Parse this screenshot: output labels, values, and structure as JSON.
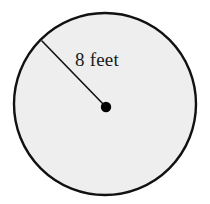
{
  "figure": {
    "kind": "circle-with-radius-diagram",
    "background_color": "#ffffff",
    "circle": {
      "fill_color": "#eeeeee",
      "stroke_color": "#111111",
      "stroke_width": 2.4,
      "center_x": 105,
      "center_y": 104,
      "radius": 91
    },
    "center_dot": {
      "color": "#000000",
      "x": 106,
      "y": 107,
      "radius": 5.2
    },
    "radius_line": {
      "color": "#111111",
      "width": 1.6,
      "x1": 42,
      "y1": 41,
      "x2": 106,
      "y2": 107
    },
    "label": {
      "text": "8 feet",
      "value": 8,
      "unit": "feet",
      "x": 75,
      "y": 66,
      "font_size": 19,
      "color": "#1a1a1a"
    }
  }
}
